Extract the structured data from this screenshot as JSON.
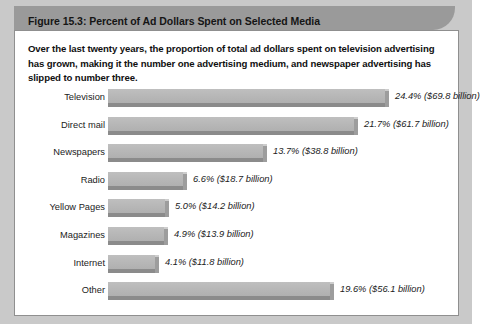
{
  "figure": {
    "title": "Figure 15.3: Percent of Ad Dollars Spent on Selected Media",
    "caption": "Over the last twenty years, the proportion of total ad dollars spent on television advertising has grown, making it the number one advertising medium, and newspaper advertising has slipped to number three.",
    "colors": {
      "title_bar": "#9a9a9a",
      "page_backing": "#c9c9c9",
      "card_border": "#8f8f8f",
      "bar_face": "#b8b8b8",
      "bar_shadow": "#8b8b8b",
      "text": "#1b1b1b"
    }
  },
  "chart_data": {
    "type": "bar",
    "title": "Figure 15.3: Percent of Ad Dollars Spent on Selected Media",
    "orientation": "horizontal",
    "xlabel": "",
    "ylabel": "",
    "grid": false,
    "legend": "none",
    "xlim": [
      0,
      25
    ],
    "categories": [
      "Television",
      "Direct mail",
      "Newspapers",
      "Radio",
      "Yellow Pages",
      "Magazines",
      "Internet",
      "Other"
    ],
    "values": [
      24.4,
      21.7,
      13.7,
      6.6,
      5.0,
      4.9,
      4.1,
      19.6
    ],
    "dollars_billion": [
      69.8,
      61.7,
      38.8,
      18.7,
      14.2,
      13.9,
      11.8,
      56.1
    ],
    "data_labels": [
      "24.4% ($69.8 billion)",
      "21.7% ($61.7 billion)",
      "13.7% ($38.8 billion)",
      "6.6% ($18.7 billion)",
      "5.0% ($14.2 billion)",
      "4.9% ($13.9 billion)",
      "4.1% ($11.8 billion)",
      "19.6% ($56.1 billion)"
    ]
  }
}
